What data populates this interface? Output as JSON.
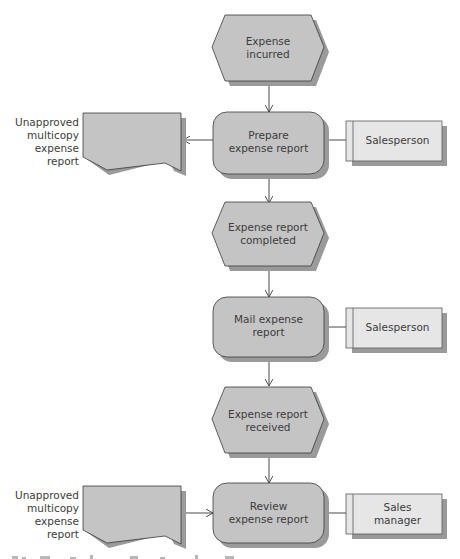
{
  "diagram": {
    "type": "event-driven process chain",
    "colors": {
      "shape_fill": "#c4c4c4",
      "shape_stroke": "#3a3a3a",
      "shadow": "#9a9a9a",
      "role_fill": "#e6e6e6",
      "connector": "#4a4a4a",
      "text": "#3c3c3c"
    },
    "events": [
      {
        "id": "e1",
        "label_line1": "Expense",
        "label_line2": "incurred"
      },
      {
        "id": "e2",
        "label_line1": "Expense report",
        "label_line2": "completed"
      },
      {
        "id": "e3",
        "label_line1": "Expense report",
        "label_line2": "received"
      }
    ],
    "functions": [
      {
        "id": "f1",
        "label_line1": "Prepare",
        "label_line2": "expense report"
      },
      {
        "id": "f2",
        "label_line1": "Mail expense",
        "label_line2": "report"
      },
      {
        "id": "f3",
        "label_line1": "Review",
        "label_line2": "expense report"
      }
    ],
    "roles": [
      {
        "id": "r1",
        "label_line1": "Salesperson",
        "label_line2": ""
      },
      {
        "id": "r2",
        "label_line1": "Salesperson",
        "label_line2": ""
      },
      {
        "id": "r3",
        "label_line1": "Sales",
        "label_line2": "manager"
      }
    ],
    "documents": [
      {
        "id": "d1",
        "label_line1": "Unapproved",
        "label_line2": "multicopy",
        "label_line3": "expense report",
        "direction": "output"
      },
      {
        "id": "d2",
        "label_line1": "Unapproved",
        "label_line2": "multicopy",
        "label_line3": "expense report",
        "direction": "input"
      }
    ],
    "flow": [
      "e1",
      "f1",
      "e2",
      "f2",
      "e3",
      "f3"
    ]
  }
}
